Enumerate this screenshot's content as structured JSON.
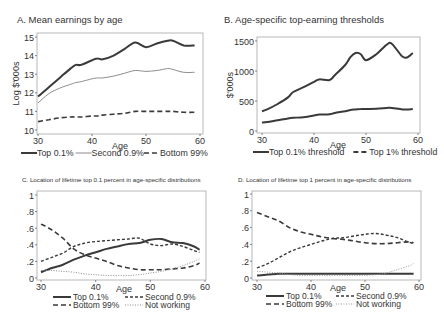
{
  "chart_data": [
    {
      "id": "A",
      "type": "line",
      "title": "A. Mean earnings by age",
      "xlabel": "Age",
      "ylabel": "Log $'000s",
      "xlim": [
        30,
        60
      ],
      "ylim": [
        10,
        15
      ],
      "xticks": [
        30,
        40,
        50,
        60
      ],
      "yticks": [
        10,
        11,
        12,
        13,
        14,
        15
      ],
      "grid": false,
      "legend_position": "bottom",
      "x": [
        30,
        32,
        34,
        36,
        37,
        38,
        40,
        41,
        42,
        44,
        46,
        48,
        50,
        52,
        54,
        55,
        57,
        59
      ],
      "series": [
        {
          "name": "Top 0.1%",
          "style": "solid-thick",
          "color": "#3a3a3a",
          "values": [
            11.8,
            12.3,
            12.8,
            13.3,
            13.5,
            13.5,
            13.75,
            13.85,
            13.8,
            14.0,
            14.35,
            14.7,
            14.45,
            14.65,
            14.8,
            14.8,
            14.55,
            14.55
          ]
        },
        {
          "name": "Second 0.9%",
          "style": "solid-thin",
          "color": "#8c8c8c",
          "values": [
            11.45,
            11.95,
            12.25,
            12.45,
            12.55,
            12.6,
            12.75,
            12.8,
            12.8,
            12.9,
            13.05,
            13.2,
            13.15,
            13.2,
            13.3,
            13.25,
            13.1,
            13.1
          ]
        },
        {
          "name": "Bottom 99%",
          "style": "dashed",
          "color": "#3a3a3a",
          "values": [
            10.45,
            10.55,
            10.65,
            10.7,
            10.7,
            10.7,
            10.75,
            10.75,
            10.8,
            10.85,
            10.9,
            11.0,
            11.0,
            11.0,
            11.0,
            11.0,
            10.95,
            10.95
          ]
        }
      ]
    },
    {
      "id": "B",
      "type": "line",
      "title": "B. Age-specific top-earning thresholds",
      "xlabel": "Age",
      "ylabel": "$'000s",
      "xlim": [
        30,
        60
      ],
      "ylim": [
        0,
        1500
      ],
      "xticks": [
        30,
        40,
        50,
        60
      ],
      "yticks": [
        0,
        500,
        1000,
        1500
      ],
      "grid": false,
      "legend_position": "bottom",
      "x": [
        30,
        31,
        33,
        35,
        36,
        38,
        40,
        41,
        43,
        44,
        46,
        47,
        48,
        49,
        50,
        52,
        54,
        55,
        57,
        58,
        59
      ],
      "series": [
        {
          "name": "Top 0.1% threshold",
          "style": "solid-thick",
          "color": "#3a3a3a",
          "values": [
            330,
            360,
            450,
            560,
            650,
            730,
            820,
            860,
            850,
            930,
            1100,
            1230,
            1300,
            1280,
            1180,
            1280,
            1440,
            1450,
            1240,
            1230,
            1300
          ]
        },
        {
          "name": "Top 1% threshold",
          "style": "solid-thick",
          "color": "#3a3a3a",
          "values": [
            140,
            150,
            180,
            210,
            220,
            230,
            260,
            275,
            280,
            300,
            330,
            350,
            360,
            365,
            365,
            370,
            385,
            385,
            360,
            360,
            365
          ]
        }
      ]
    },
    {
      "id": "C",
      "type": "line",
      "title": "C. Location of lifetime top 0.1 percent in age-specific distributions",
      "xlabel": "Age",
      "ylabel": "",
      "xlim": [
        30,
        60
      ],
      "ylim": [
        0,
        1
      ],
      "xticks": [
        30,
        40,
        50,
        60
      ],
      "ytick_labels": [
        "0",
        ".2",
        ".4",
        ".6",
        ".8",
        "1"
      ],
      "yticks": [
        0,
        0.2,
        0.4,
        0.6,
        0.8,
        1
      ],
      "grid": false,
      "legend_position": "bottom",
      "x": [
        30,
        32,
        34,
        36,
        38,
        40,
        42,
        44,
        46,
        48,
        50,
        52,
        54,
        56,
        58,
        59
      ],
      "series": [
        {
          "name": "Top 0.1%",
          "style": "solid-thick",
          "color": "#3a3a3a",
          "values": [
            0.07,
            0.12,
            0.16,
            0.22,
            0.27,
            0.31,
            0.35,
            0.38,
            0.41,
            0.42,
            0.46,
            0.47,
            0.43,
            0.42,
            0.38,
            0.34
          ]
        },
        {
          "name": "Second 0.9%",
          "style": "short-dash",
          "color": "#3a3a3a",
          "values": [
            0.2,
            0.25,
            0.3,
            0.38,
            0.42,
            0.44,
            0.45,
            0.46,
            0.47,
            0.48,
            0.41,
            0.39,
            0.41,
            0.38,
            0.33,
            0.31
          ]
        },
        {
          "name": "Bottom 99%",
          "style": "dashed",
          "color": "#3a3a3a",
          "values": [
            0.65,
            0.58,
            0.48,
            0.35,
            0.28,
            0.24,
            0.2,
            0.15,
            0.12,
            0.1,
            0.1,
            0.1,
            0.11,
            0.12,
            0.15,
            0.18
          ]
        },
        {
          "name": "Not working",
          "style": "dotted",
          "color": "#8c8c8c",
          "values": [
            0.09,
            0.09,
            0.08,
            0.07,
            0.05,
            0.04,
            0.03,
            0.03,
            0.03,
            0.04,
            0.06,
            0.08,
            0.11,
            0.15,
            0.2,
            0.23
          ]
        }
      ]
    },
    {
      "id": "D",
      "type": "line",
      "title": "D. Location of lifetime top 1 percent in age-specific distributions",
      "xlabel": "Age",
      "ylabel": "",
      "xlim": [
        30,
        60
      ],
      "ylim": [
        0,
        1
      ],
      "xticks": [
        30,
        40,
        50,
        60
      ],
      "ytick_labels": [
        "0",
        ".2",
        ".4",
        ".6",
        ".8",
        "1"
      ],
      "yticks": [
        0,
        0.2,
        0.4,
        0.6,
        0.8,
        1
      ],
      "grid": false,
      "legend_position": "bottom",
      "x": [
        30,
        32,
        34,
        36,
        38,
        40,
        42,
        44,
        46,
        48,
        50,
        52,
        54,
        56,
        58,
        59
      ],
      "series": [
        {
          "name": "Top 0.1%",
          "style": "solid-thick",
          "color": "#3a3a3a",
          "values": [
            0.03,
            0.04,
            0.05,
            0.05,
            0.05,
            0.05,
            0.05,
            0.05,
            0.05,
            0.05,
            0.05,
            0.05,
            0.05,
            0.05,
            0.05,
            0.05
          ]
        },
        {
          "name": "Second 0.9%",
          "style": "short-dash",
          "color": "#3a3a3a",
          "values": [
            0.12,
            0.17,
            0.24,
            0.31,
            0.36,
            0.4,
            0.44,
            0.47,
            0.48,
            0.5,
            0.52,
            0.53,
            0.51,
            0.48,
            0.43,
            0.41
          ]
        },
        {
          "name": "Bottom 99%",
          "style": "dashed",
          "color": "#3a3a3a",
          "values": [
            0.78,
            0.73,
            0.68,
            0.6,
            0.55,
            0.52,
            0.49,
            0.47,
            0.46,
            0.44,
            0.42,
            0.41,
            0.41,
            0.42,
            0.43,
            0.42
          ]
        },
        {
          "name": "Not working",
          "style": "dotted",
          "color": "#9a9a9a",
          "values": [
            0.08,
            0.07,
            0.06,
            0.04,
            0.03,
            0.03,
            0.03,
            0.03,
            0.03,
            0.03,
            0.03,
            0.04,
            0.06,
            0.1,
            0.14,
            0.17
          ]
        }
      ]
    }
  ],
  "layout": {
    "panels": [
      {
        "id": "A",
        "box": [
          37,
          33,
          203,
          134
        ],
        "xmap": [
          38,
          200
        ],
        "ymap": [
          130,
          37
        ],
        "title_xy": [
          17,
          23
        ],
        "title_size": 9.5,
        "ylabel_x": 19,
        "xlabel_xy": [
          120,
          149
        ],
        "legend_rows": 1,
        "legend_y": 156
      },
      {
        "id": "B",
        "box": [
          257,
          37,
          420,
          133
        ],
        "xmap": [
          262,
          418
        ],
        "ymap": [
          131,
          41
        ],
        "title_xy": [
          224,
          23
        ],
        "title_size": 9.5,
        "ylabel_x": 233,
        "xlabel_xy": [
          338,
          148
        ],
        "legend_rows": 1,
        "legend_y": 155
      },
      {
        "id": "C",
        "box": [
          37,
          191,
          206,
          280
        ],
        "xmap": [
          41,
          205
        ],
        "ymap": [
          278,
          195
        ],
        "title_xy": [
          22,
          182
        ],
        "title_size": 6.2,
        "ylabel_x": 0,
        "xlabel_xy": [
          124,
          292
        ],
        "legend_rows": 2,
        "legend_y": 300
      },
      {
        "id": "D",
        "box": [
          252,
          191,
          421,
          280
        ],
        "xmap": [
          257,
          419
        ],
        "ymap": [
          278,
          194
        ],
        "title_xy": [
          238,
          182
        ],
        "title_size": 6.2,
        "ylabel_x": 0,
        "xlabel_xy": [
          338,
          291
        ],
        "legend_rows": 2,
        "legend_y": 299
      }
    ],
    "frame_color": "#b8b8b8",
    "text_color": "#3a3a3a"
  }
}
